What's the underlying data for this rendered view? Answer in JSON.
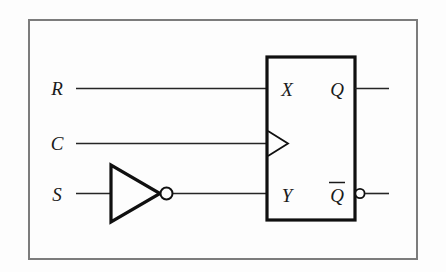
{
  "figure": {
    "type": "logic-circuit-diagram",
    "background_color": "#fdfdfd",
    "frame_color": "#7c7c7c",
    "line_color": "#262626",
    "gate_color": "#101010"
  },
  "inputs": [
    {
      "name": "input-r",
      "label": "R",
      "x": 62,
      "y": 88
    },
    {
      "name": "input-c",
      "label": "C",
      "x": 62,
      "y": 143
    },
    {
      "name": "input-s",
      "label": "S",
      "x": 62,
      "y": 194
    }
  ],
  "not_gate": {
    "name": "not-gate",
    "label": "NOT",
    "bubble_label": "inversion-bubble"
  },
  "flipflop": {
    "name": "flip-flop-block",
    "input_ports": [
      {
        "label": "X",
        "x": 287,
        "y": 90
      },
      {
        "label": "Y",
        "x": 287,
        "y": 196
      }
    ],
    "clock_port": {
      "label": "clock-triangle",
      "y": 143
    },
    "output_ports": [
      {
        "label": "Q",
        "x": 337,
        "y": 90,
        "inverted": false
      },
      {
        "label": "Q",
        "x": 337,
        "y": 196,
        "inverted": true,
        "overbar": true
      }
    ]
  },
  "outputs": [
    {
      "name": "output-q",
      "label": "Q"
    },
    {
      "name": "output-q-bar",
      "label": "Q̄"
    }
  ]
}
